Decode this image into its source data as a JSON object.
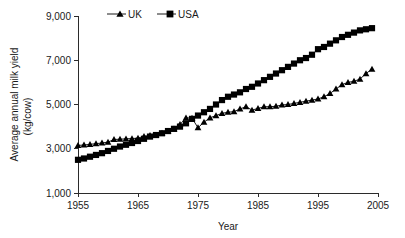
{
  "chart_data": {
    "type": "line",
    "title": "",
    "xlabel": "Year",
    "ylabel": "Average annual milk yield (kg/cow)",
    "ylabel_line1": "Average annual milk yield",
    "ylabel_line2": "(kg/cow)",
    "xlim": [
      1955,
      2005
    ],
    "ylim": [
      1000,
      9000
    ],
    "xticks": [
      1955,
      1965,
      1975,
      1985,
      1995,
      2005
    ],
    "xtick_labels": [
      "1955",
      "1965",
      "1975",
      "1985",
      "1995",
      "2005"
    ],
    "yticks": [
      1000,
      3000,
      5000,
      7000,
      9000
    ],
    "ytick_labels": [
      "1,000",
      "3,000",
      "5,000",
      "7,000",
      "9,000"
    ],
    "grid": false,
    "legend_position": "top-center",
    "legend": [
      {
        "name": "UK",
        "marker": "triangle"
      },
      {
        "name": "USA",
        "marker": "square"
      }
    ],
    "series": [
      {
        "name": "UK",
        "marker": "triangle",
        "x": [
          1955,
          1956,
          1957,
          1958,
          1959,
          1960,
          1961,
          1962,
          1963,
          1964,
          1965,
          1966,
          1967,
          1968,
          1969,
          1970,
          1971,
          1972,
          1973,
          1974,
          1975,
          1976,
          1977,
          1978,
          1979,
          1980,
          1981,
          1982,
          1983,
          1984,
          1985,
          1986,
          1987,
          1988,
          1989,
          1990,
          1991,
          1992,
          1993,
          1994,
          1995,
          1996,
          1997,
          1998,
          1999,
          2000,
          2001,
          2002,
          2003,
          2004
        ],
        "values": [
          3150,
          3170,
          3200,
          3230,
          3260,
          3300,
          3420,
          3430,
          3450,
          3460,
          3480,
          3560,
          3600,
          3620,
          3700,
          3800,
          3900,
          4100,
          4400,
          4380,
          3950,
          4200,
          4400,
          4500,
          4600,
          4650,
          4680,
          4800,
          4900,
          4750,
          4820,
          4900,
          4900,
          4920,
          4980,
          5000,
          5050,
          5100,
          5150,
          5200,
          5250,
          5350,
          5500,
          5700,
          5900,
          6000,
          6050,
          6150,
          6400,
          6600
        ]
      },
      {
        "name": "USA",
        "marker": "square",
        "x": [
          1955,
          1956,
          1957,
          1958,
          1959,
          1960,
          1961,
          1962,
          1963,
          1964,
          1965,
          1966,
          1967,
          1968,
          1969,
          1970,
          1971,
          1972,
          1973,
          1974,
          1975,
          1976,
          1977,
          1978,
          1979,
          1980,
          1981,
          1982,
          1983,
          1984,
          1985,
          1986,
          1987,
          1988,
          1989,
          1990,
          1991,
          1992,
          1993,
          1994,
          1995,
          1996,
          1997,
          1998,
          1999,
          2000,
          2001,
          2002,
          2003,
          2004
        ],
        "values": [
          2500,
          2560,
          2640,
          2720,
          2800,
          2900,
          3000,
          3100,
          3180,
          3260,
          3350,
          3450,
          3550,
          3620,
          3700,
          3800,
          3900,
          4000,
          4150,
          4350,
          4500,
          4650,
          4800,
          5000,
          5200,
          5350,
          5450,
          5550,
          5700,
          5800,
          5950,
          6100,
          6250,
          6400,
          6550,
          6700,
          6850,
          7000,
          7100,
          7250,
          7500,
          7600,
          7750,
          7900,
          8050,
          8150,
          8250,
          8350,
          8400,
          8450
        ]
      }
    ]
  },
  "axes": {
    "x_title": "Year",
    "y_title_line1": "Average annual milk yield",
    "y_title_line2": "(kg/cow)"
  },
  "legend": {
    "uk_label": "UK",
    "usa_label": "USA"
  }
}
